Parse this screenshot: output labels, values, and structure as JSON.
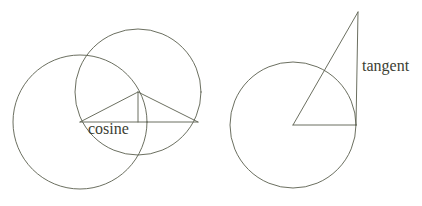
{
  "figure": {
    "background_color": "#ffffff",
    "stroke_color": "#5a5f4e",
    "text_color": "#3c4033",
    "width": 422,
    "height": 206
  },
  "labels": {
    "cosine": "cosine",
    "tangent": "tangent"
  },
  "left_diagram": {
    "name": "cosine-construction",
    "circles": [
      {
        "name": "left-circle",
        "cx": 80,
        "cy": 122,
        "r": 67
      },
      {
        "name": "right-circle",
        "cx": 138,
        "cy": 92,
        "r": 63
      }
    ],
    "triangle": {
      "apex": {
        "x": 138,
        "y": 92
      },
      "left_vertex": {
        "x": 80,
        "y": 122
      },
      "right_vertex": {
        "x": 198,
        "y": 122
      }
    },
    "baseline": {
      "x1": 80,
      "y1": 122,
      "x2": 198,
      "y2": 122
    },
    "vertical_drop": {
      "x1": 138,
      "y1": 92,
      "x2": 138,
      "y2": 122
    },
    "label_position": {
      "x": 88,
      "y": 134
    }
  },
  "right_diagram": {
    "name": "tangent-construction",
    "circle": {
      "name": "tangent-circle",
      "cx": 293,
      "cy": 125,
      "r": 63
    },
    "center_point": {
      "x": 293,
      "y": 125
    },
    "radius_line": {
      "x1": 293,
      "y1": 125,
      "x2": 356,
      "y2": 125
    },
    "hypotenuse": {
      "x1": 293,
      "y1": 125,
      "x2": 358,
      "y2": 12
    },
    "tangent_line": {
      "x1": 356,
      "y1": 125,
      "x2": 358,
      "y2": 12
    },
    "label_position": {
      "x": 362,
      "y": 71
    }
  }
}
